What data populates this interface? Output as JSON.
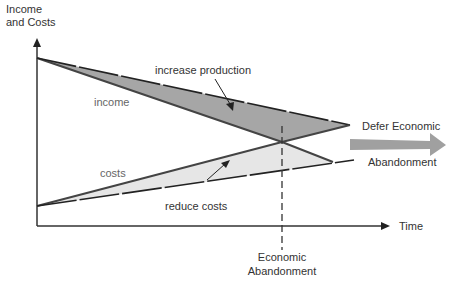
{
  "diagram": {
    "y_axis_label_line1": "Income",
    "y_axis_label_line2": "and Costs",
    "x_axis_label": "Time",
    "income_label": "income",
    "costs_label": "costs",
    "increase_label": "increase production",
    "reduce_label": "reduce costs",
    "defer_label_line1": "Defer Economic",
    "defer_label_line2": "Abandonment",
    "abandon_label_line1": "Economic",
    "abandon_label_line2": "Abandonment",
    "colors": {
      "income_area": "#a6a6a6",
      "costs_area": "#e6e6e6",
      "defer_arrow": "#a0a0a0",
      "lines": "#333333"
    }
  }
}
